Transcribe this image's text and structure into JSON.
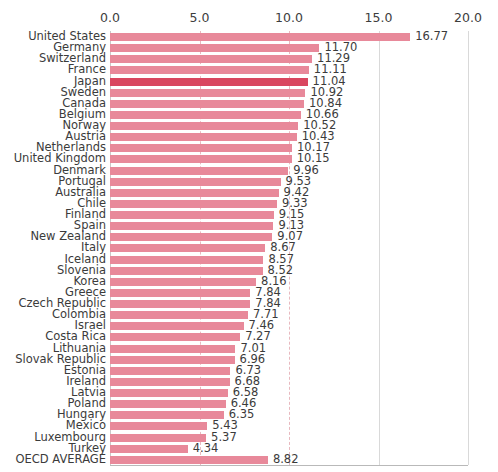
{
  "chart_data": {
    "type": "bar",
    "orientation": "horizontal",
    "title": "",
    "xlabel": "",
    "ylabel": "",
    "xlim": [
      0.0,
      20.0
    ],
    "xticks": [
      "0.0",
      "5.0",
      "10.0",
      "15.0",
      "20.0"
    ],
    "xtick_values": [
      0.0,
      5.0,
      10.0,
      15.0,
      20.0
    ],
    "grid": true,
    "legend": "none",
    "highlight_category": "Japan",
    "colors": {
      "bar": "#e8899a",
      "bar_highlight": "#d9465f",
      "gridline": "#d9d9d9",
      "gridline_accent": "#e8b9bf",
      "text": "#3b3b3b",
      "background": "#ffffff"
    },
    "categories": [
      "United States",
      "Germany",
      "Switzerland",
      "France",
      "Japan",
      "Sweden",
      "Canada",
      "Belgium",
      "Norway",
      "Austria",
      "Netherlands",
      "United Kingdom",
      "Denmark",
      "Portugal",
      "Australia",
      "Chile",
      "Finland",
      "Spain",
      "New Zealand",
      "Italy",
      "Iceland",
      "Slovenia",
      "Korea",
      "Greece",
      "Czech Republic",
      "Colombia",
      "Israel",
      "Costa Rica",
      "Lithuania",
      "Slovak Republic",
      "Estonia",
      "Ireland",
      "Latvia",
      "Poland",
      "Hungary",
      "Mexico",
      "Luxembourg",
      "Turkey",
      "OECD AVERAGE"
    ],
    "values": [
      16.77,
      11.7,
      11.29,
      11.11,
      11.04,
      10.92,
      10.84,
      10.66,
      10.52,
      10.43,
      10.17,
      10.15,
      9.96,
      9.53,
      9.42,
      9.33,
      9.15,
      9.13,
      9.07,
      8.67,
      8.57,
      8.52,
      8.16,
      7.84,
      7.84,
      7.71,
      7.46,
      7.27,
      7.01,
      6.96,
      6.73,
      6.68,
      6.58,
      6.46,
      6.35,
      5.43,
      5.37,
      4.34,
      8.82
    ],
    "value_labels": [
      "16.77",
      "11.70",
      "11.29",
      "11.11",
      "11.04",
      "10.92",
      "10.84",
      "10.66",
      "10.52",
      "10.43",
      "10.17",
      "10.15",
      "9.96",
      "9.53",
      "9.42",
      "9.33",
      "9.15",
      "9.13",
      "9.07",
      "8.67",
      "8.57",
      "8.52",
      "8.16",
      "7.84",
      "7.84",
      "7.71",
      "7.46",
      "7.27",
      "7.01",
      "6.96",
      "6.73",
      "6.68",
      "6.58",
      "6.46",
      "6.35",
      "5.43",
      "5.37",
      "4.34",
      "8.82"
    ]
  }
}
